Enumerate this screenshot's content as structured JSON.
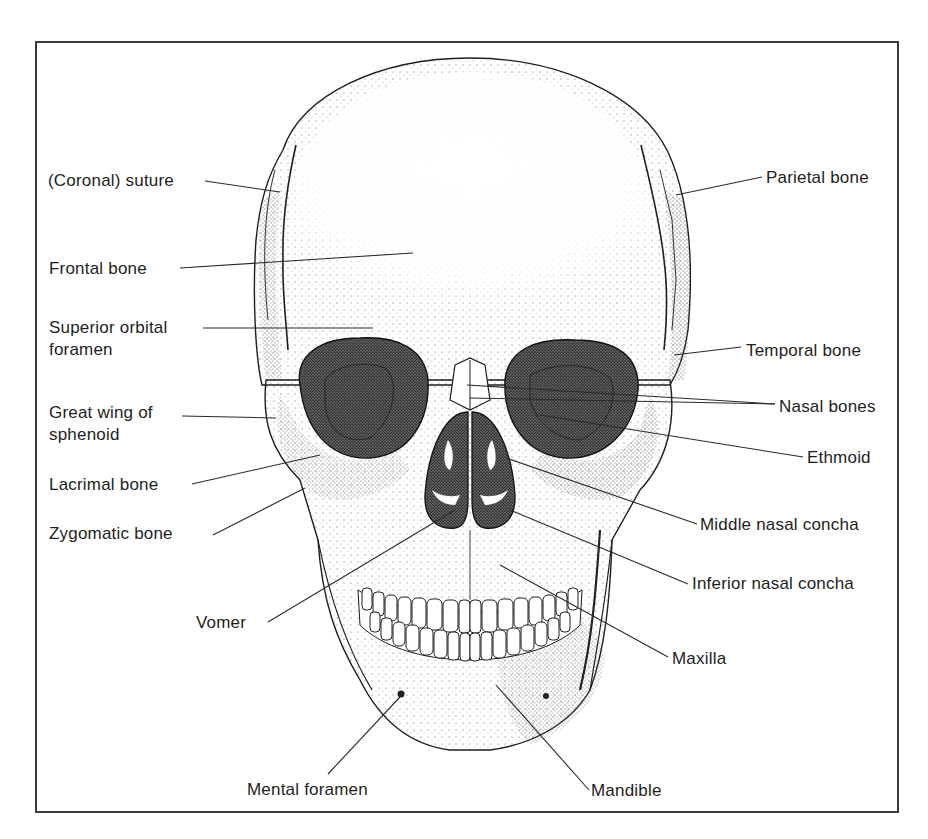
{
  "figure": {
    "labels_left": [
      {
        "id": "coronal-suture",
        "text": "(Coronal) suture",
        "x": 48,
        "y": 171
      },
      {
        "id": "frontal-bone",
        "text": "Frontal bone",
        "x": 49,
        "y": 259
      },
      {
        "id": "superior-orbital-foramen",
        "text": "Superior orbital\nforamen",
        "line1": "Superior orbital",
        "line2": "foramen",
        "x": 49,
        "y": 318
      },
      {
        "id": "great-wing-of-sphenoid",
        "text": "Great wing of\nsphenoid",
        "line1": "Great wing of",
        "line2": "sphenoid",
        "x": 49,
        "y": 403
      },
      {
        "id": "lacrimal-bone",
        "text": "Lacrimal bone",
        "x": 49,
        "y": 475
      },
      {
        "id": "zygomatic-bone",
        "text": "Zygomatic bone",
        "x": 49,
        "y": 524
      },
      {
        "id": "vomer",
        "text": "Vomer",
        "x": 196,
        "y": 613
      },
      {
        "id": "mental-foramen",
        "text": "Mental foramen",
        "x": 247,
        "y": 780
      }
    ],
    "labels_right": [
      {
        "id": "parietal-bone",
        "text": "Parietal bone",
        "x": 766,
        "y": 168
      },
      {
        "id": "temporal-bone",
        "text": "Temporal bone",
        "x": 746,
        "y": 341
      },
      {
        "id": "nasal-bones",
        "text": "Nasal bones",
        "x": 779,
        "y": 397
      },
      {
        "id": "ethmoid",
        "text": "Ethmoid",
        "x": 807,
        "y": 448
      },
      {
        "id": "middle-nasal-concha",
        "text": "Middle nasal concha",
        "x": 700,
        "y": 515
      },
      {
        "id": "inferior-nasal-concha",
        "text": "Inferior nasal concha",
        "x": 692,
        "y": 574
      },
      {
        "id": "maxilla",
        "text": "Maxilla",
        "x": 672,
        "y": 649
      },
      {
        "id": "mandible",
        "text": "Mandible",
        "x": 591,
        "y": 781
      }
    ],
    "colors": {
      "ink": "#1e1e1e",
      "frame": "#3a3a3a",
      "shade_dark": "#2a2a2a",
      "shade_mid": "#8a8a8a",
      "background": "#ffffff"
    }
  }
}
